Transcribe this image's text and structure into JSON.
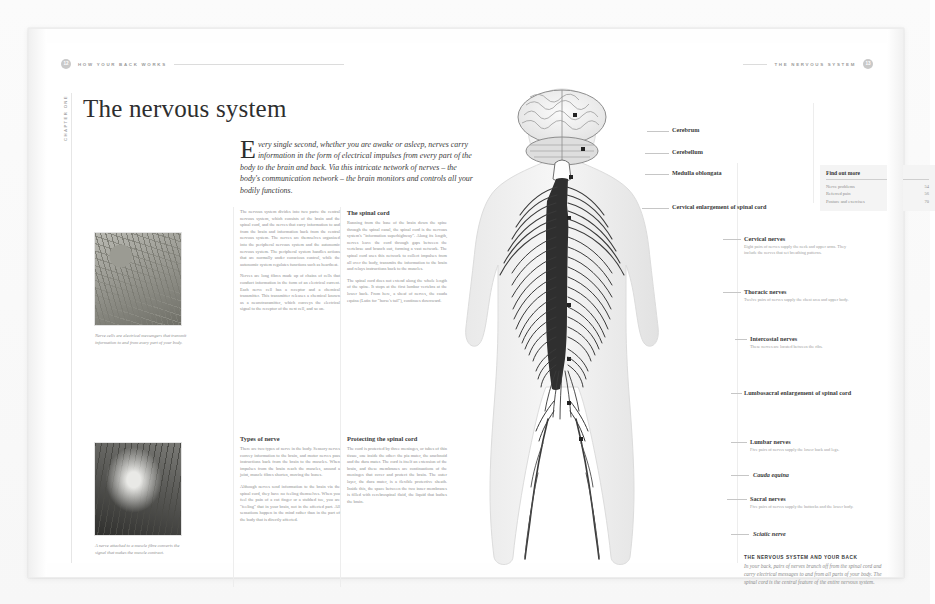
{
  "page": {
    "left_running_head": "HOW YOUR BACK WORKS",
    "left_folio": "12",
    "right_running_head": "THE NERVOUS SYSTEM",
    "right_folio": "13",
    "chapter_tab": "CHAPTER ONE",
    "headline": "The nervous system",
    "standfirst_dropcap": "E",
    "standfirst": "very single second, whether you are awake or asleep, nerves carry information in the form of electrical impulses from every part of the body to the brain and back. Via this intricate network of nerves – the body's communication network – the brain monitors and controls all your bodily functions."
  },
  "columns": [
    {
      "id": "col-1",
      "heading": "",
      "paragraphs": [
        "The nervous system divides into two parts: the central nervous system, which consists of the brain and the spinal cord, and the nerves that carry information to and from the brain and information back from the central nervous system. The nerves are themselves organized into the peripheral nervous system and the autonomic nervous system. The peripheral system handles actions that are normally under conscious control, while the autonomic system regulates functions such as heartbeat.",
        "Nerves are long fibres made up of chains of cells that conduct information in the form of an electrical current. Each nerve cell has a receptor and a chemical transmitter. This transmitter releases a chemical known as a neurotransmitter, which conveys the electrical signal to the receptor of the next cell, and so on."
      ]
    },
    {
      "id": "col-2",
      "heading": "The spinal cord",
      "paragraphs": [
        "Running from the base of the brain down the spine through the spinal canal, the spinal cord is the nervous system's \"information superhighway\". Along its length, nerves leave the cord through gaps between the vertebrae and branch out, forming a vast network. The spinal cord uses this network to collect impulses from all over the body, transmits the information to the brain and relays instructions back to the muscles.",
        "The spinal cord does not extend along the whole length of the spine. It stops at the first lumbar vertebra at the lower back. From here, a sheaf of nerves, the cauda equina (Latin for \"horse's tail\"), continues downward."
      ]
    },
    {
      "id": "col-3",
      "heading": "Types of nerve",
      "paragraphs": [
        "There are two types of nerve in the body. Sensory nerves convey information to the brain, and motor nerves pass instructions back from the brain to the muscles. When impulses from the brain reach the muscles, around a joint, muscle fibres shorten, moving the bones.",
        "Although nerves send information to the brain via the spinal cord, they have no feeling themselves. When you feel the pain of a cut finger or a stubbed toe, you are \"feeling\" that in your brain, not in the affected part. All sensations happen in the mind rather than in the part of the body that is directly affected."
      ]
    },
    {
      "id": "col-4",
      "heading": "Protecting the spinal cord",
      "paragraphs": [
        "The cord is protected by three meninges, or tubes of thin tissue, one inside the other: the pia mater, the arachnoid and the dura mater. The cord is itself an extension of the brain, and these membranes are continuations of the meninges that cover and protect the brain. The outer layer, the dura mater, is a flexible protective sheath. Inside this, the space between the two inner membranes is filled with cerebrospinal fluid, the liquid that bathes the brain."
      ]
    }
  ],
  "photos": [
    {
      "id": "photo-nerve-cells",
      "caption": "Nerve cells are electrical messengers that transmit information to and from every part of your body."
    },
    {
      "id": "photo-muscle-fibre",
      "caption": "A nerve attached to a muscle fibre converts the signal that makes the muscle contract."
    }
  ],
  "diagram_labels": [
    {
      "id": "cerebrum",
      "title": "Cerebrum",
      "desc": ""
    },
    {
      "id": "cerebellum",
      "title": "Cerebellum",
      "desc": ""
    },
    {
      "id": "medulla",
      "title": "Medulla oblongata",
      "desc": ""
    },
    {
      "id": "cervical-enlargement",
      "title": "Cervical enlargement of spinal cord",
      "desc": ""
    },
    {
      "id": "cervical-nerves",
      "title": "Cervical nerves",
      "desc": "Eight pairs of nerves supply the neck and upper arms. They include the nerves that set breathing patterns."
    },
    {
      "id": "thoracic-nerves",
      "title": "Thoracic nerves",
      "desc": "Twelve pairs of nerves supply the chest area and upper body."
    },
    {
      "id": "intercostal-nerves",
      "title": "Intercostal nerves",
      "desc": "These nerves are located between the ribs."
    },
    {
      "id": "lumbosacral-enlargement",
      "title": "Lumbosacral enlargement of spinal cord",
      "desc": ""
    },
    {
      "id": "lumbar-nerves",
      "title": "Lumbar nerves",
      "desc": "Five pairs of nerves supply the lower back and legs."
    },
    {
      "id": "cauda-equina",
      "title": "Cauda equina",
      "desc": ""
    },
    {
      "id": "sacral-nerves",
      "title": "Sacral nerves",
      "desc": "Five pairs of nerves supply the buttocks and the lower body."
    },
    {
      "id": "sciatic-nerve",
      "title": "Sciatic nerve",
      "desc": ""
    }
  ],
  "find_out_more": {
    "title": "Find out more",
    "rows": [
      {
        "label": "Nerve problems",
        "page": "54"
      },
      {
        "label": "Referred pain",
        "page": "56"
      },
      {
        "label": "Posture and exercises",
        "page": "70"
      }
    ]
  },
  "note": {
    "heading": "THE NERVOUS SYSTEM AND YOUR BACK",
    "body": "In your back, pairs of nerves branch off from the spinal cord and carry electrical messages to and from all parts of your body. The spinal cord is the central feature of the entire nervous system."
  }
}
